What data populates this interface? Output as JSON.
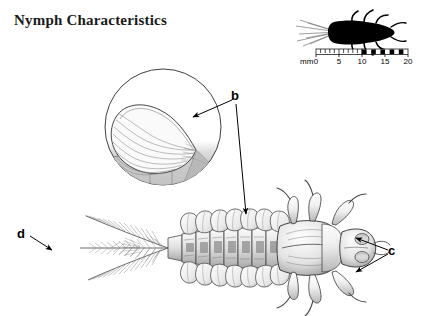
{
  "page": {
    "title": "Nymph Characteristics",
    "background_color": "#ffffff",
    "width": 425,
    "height": 316
  },
  "figure": {
    "line_color": "#3a3a3a",
    "shading_color": "#9a9a9a",
    "silhouette_color": "#000000"
  },
  "callouts": [
    {
      "id": "b",
      "label": "b",
      "target": "abdominal-gills",
      "arrow_count": 2
    },
    {
      "id": "c",
      "label": "c",
      "target": "legs-and-claws",
      "arrow_count": 2
    },
    {
      "id": "d",
      "label": "d",
      "target": "caudal-filaments",
      "arrow_count": 1
    }
  ],
  "inset": {
    "name": "gill-magnification-circle",
    "shape": "circle"
  },
  "scale_bar": {
    "unit_label": "mm",
    "ticks": [
      "0",
      "5",
      "10",
      "15",
      "20"
    ],
    "max": 20,
    "minor_interval": 1
  }
}
